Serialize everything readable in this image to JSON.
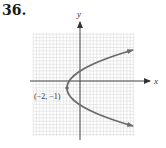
{
  "problem": {
    "number": "36."
  },
  "chart_data": {
    "type": "line",
    "title": "",
    "xlabel": "x",
    "ylabel": "y",
    "grid": true,
    "curve": "parabola opening right",
    "equation_form": "x = a(y + 1)^2 - 2",
    "vertex": {
      "x": -2,
      "y": -1,
      "label": "(−2, −1)"
    },
    "series": [
      {
        "name": "parabola",
        "points": [
          [
            8,
            4.8
          ],
          [
            0,
            1.5
          ],
          [
            -2,
            -1
          ],
          [
            0,
            -3.5
          ],
          [
            8,
            -6.8
          ]
        ]
      }
    ],
    "xlim": [
      -7,
      8
    ],
    "ylim": [
      -8,
      7
    ],
    "arrows": [
      "upper-right",
      "lower-right"
    ],
    "colors": {
      "curve": "#6b6b6b",
      "axis": "#555555",
      "grid": "#cfcfcf"
    }
  }
}
